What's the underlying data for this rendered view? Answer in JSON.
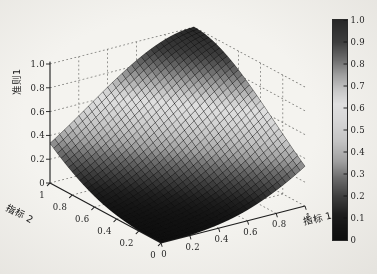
{
  "figure": {
    "background": "#eae8e4",
    "xlabel": "指标 1",
    "ylabel": "指标 2",
    "zlabel": "准则1",
    "x_tick_labels": [
      "0",
      "0.2",
      "0.4",
      "0.6",
      "0.8",
      "1"
    ],
    "y_tick_labels": [
      "0",
      "0.2",
      "0.4",
      "0.6",
      "0.8",
      "1"
    ],
    "z_tick_labels": [
      "0",
      "0.2",
      "0.4",
      "0.6",
      "0.8",
      "1.0"
    ],
    "colorbar": {
      "min": 0,
      "max": 1,
      "tick_labels": [
        "0",
        "0.1",
        "0.2",
        "0.3",
        "0.4",
        "0.5",
        "0.6",
        "0.7",
        "0.8",
        "0.9",
        "1.0"
      ]
    }
  },
  "chart_data": {
    "type": "surface",
    "title": "",
    "xlabel": "指标 1",
    "ylabel": "指标 2",
    "zlabel": "准则1",
    "x_range": [
      0,
      1
    ],
    "y_range": [
      0,
      1
    ],
    "z_range": [
      0,
      1
    ],
    "grid": true,
    "x": [
      0,
      0.1,
      0.2,
      0.3,
      0.4,
      0.5,
      0.6,
      0.7,
      0.8,
      0.9,
      1.0
    ],
    "y": [
      0,
      0.1,
      0.2,
      0.3,
      0.4,
      0.5,
      0.6,
      0.7,
      0.8,
      0.9,
      1.0
    ],
    "z_grid": [
      [
        0.0,
        0.001,
        0.005,
        0.015,
        0.032,
        0.057,
        0.092,
        0.138,
        0.194,
        0.259,
        0.334
      ],
      [
        0.001,
        0.005,
        0.015,
        0.032,
        0.057,
        0.092,
        0.138,
        0.194,
        0.259,
        0.334,
        0.416
      ],
      [
        0.005,
        0.015,
        0.032,
        0.057,
        0.092,
        0.138,
        0.194,
        0.259,
        0.334,
        0.416,
        0.503
      ],
      [
        0.015,
        0.032,
        0.057,
        0.092,
        0.138,
        0.194,
        0.259,
        0.334,
        0.416,
        0.503,
        0.592
      ],
      [
        0.032,
        0.057,
        0.092,
        0.138,
        0.194,
        0.259,
        0.334,
        0.416,
        0.503,
        0.592,
        0.681
      ],
      [
        0.057,
        0.092,
        0.138,
        0.194,
        0.259,
        0.334,
        0.416,
        0.503,
        0.592,
        0.681,
        0.765
      ],
      [
        0.092,
        0.138,
        0.194,
        0.259,
        0.334,
        0.416,
        0.503,
        0.592,
        0.681,
        0.765,
        0.842
      ],
      [
        0.138,
        0.194,
        0.259,
        0.334,
        0.416,
        0.503,
        0.592,
        0.681,
        0.765,
        0.842,
        0.907
      ],
      [
        0.194,
        0.259,
        0.334,
        0.416,
        0.503,
        0.592,
        0.681,
        0.765,
        0.842,
        0.907,
        0.957
      ],
      [
        0.259,
        0.334,
        0.416,
        0.503,
        0.592,
        0.681,
        0.765,
        0.842,
        0.907,
        0.957,
        0.989
      ],
      [
        0.334,
        0.416,
        0.503,
        0.592,
        0.681,
        0.765,
        0.842,
        0.907,
        0.957,
        0.989,
        1.0
      ]
    ],
    "diag_profile": [
      0,
      0.001,
      0.005,
      0.015,
      0.032,
      0.057,
      0.092,
      0.138,
      0.194,
      0.259,
      0.334,
      0.416,
      0.503,
      0.592,
      0.681,
      0.765,
      0.842,
      0.907,
      0.957,
      0.989,
      1.0
    ],
    "colormap": "jet-printed-grayscale",
    "colormap_gray_stops": [
      [
        0.0,
        14
      ],
      [
        0.06,
        20
      ],
      [
        0.12,
        30
      ],
      [
        0.2,
        62
      ],
      [
        0.28,
        105
      ],
      [
        0.36,
        160
      ],
      [
        0.45,
        195
      ],
      [
        0.55,
        215
      ],
      [
        0.62,
        223
      ],
      [
        0.68,
        200
      ],
      [
        0.75,
        160
      ],
      [
        0.82,
        110
      ],
      [
        0.9,
        62
      ],
      [
        1.0,
        40
      ]
    ]
  }
}
